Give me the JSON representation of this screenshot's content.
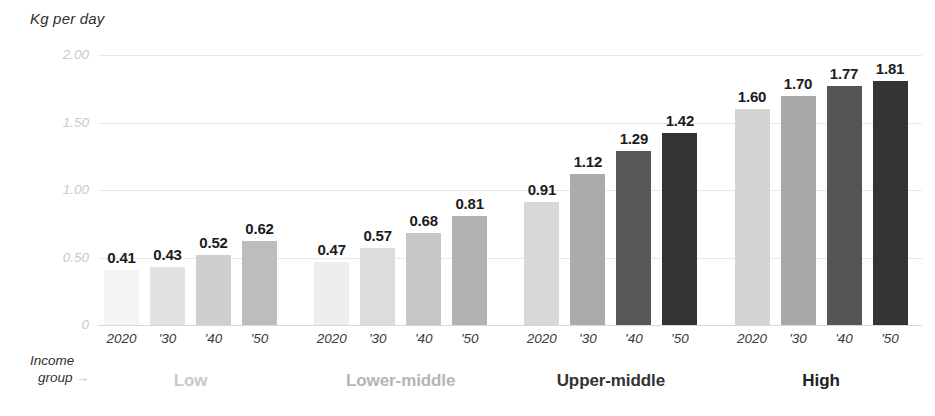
{
  "chart_data": {
    "type": "bar",
    "title": "",
    "ylabel": "Kg per day",
    "xlabel": "Income group",
    "ylim": [
      0,
      2.0
    ],
    "grid": true,
    "legend": "none",
    "yticks": [
      "0",
      "0.50",
      "1.00",
      "1.50",
      "2.00"
    ],
    "ytick_values": [
      0,
      0.5,
      1.0,
      1.5,
      2.0
    ],
    "categories": [
      "2020",
      "'30",
      "'40",
      "'50"
    ],
    "groups": [
      {
        "name": "Low",
        "label_color": "#c9c9c9",
        "bars": [
          {
            "x": "2020",
            "value": 0.41,
            "label": "0.41",
            "color": "#f4f4f4"
          },
          {
            "x": "'30",
            "value": 0.43,
            "label": "0.43",
            "color": "#e2e2e2"
          },
          {
            "x": "'40",
            "value": 0.52,
            "label": "0.52",
            "color": "#cfcfcf"
          },
          {
            "x": "'50",
            "value": 0.62,
            "label": "0.62",
            "color": "#bdbdbd"
          }
        ]
      },
      {
        "name": "Lower-middle",
        "label_color": "#b5b5b5",
        "bars": [
          {
            "x": "2020",
            "value": 0.47,
            "label": "0.47",
            "color": "#eeeeee"
          },
          {
            "x": "'30",
            "value": 0.57,
            "label": "0.57",
            "color": "#dcdcdc"
          },
          {
            "x": "'40",
            "value": 0.68,
            "label": "0.68",
            "color": "#c6c6c6"
          },
          {
            "x": "'50",
            "value": 0.81,
            "label": "0.81",
            "color": "#b2b2b2"
          }
        ]
      },
      {
        "name": "Upper-middle",
        "label_color": "#333333",
        "bars": [
          {
            "x": "2020",
            "value": 0.91,
            "label": "0.91",
            "color": "#d8d8d8"
          },
          {
            "x": "'30",
            "value": 1.12,
            "label": "1.12",
            "color": "#ababab"
          },
          {
            "x": "'40",
            "value": 1.29,
            "label": "1.29",
            "color": "#585858"
          },
          {
            "x": "'50",
            "value": 1.42,
            "label": "1.42",
            "color": "#333333"
          }
        ]
      },
      {
        "name": "High",
        "label_color": "#222222",
        "bars": [
          {
            "x": "2020",
            "value": 1.6,
            "label": "1.60",
            "color": "#d4d4d4"
          },
          {
            "x": "'30",
            "value": 1.7,
            "label": "1.70",
            "color": "#a8a8a8"
          },
          {
            "x": "'40",
            "value": 1.77,
            "label": "1.77",
            "color": "#555555"
          },
          {
            "x": "'50",
            "value": 1.81,
            "label": "1.81",
            "color": "#343434"
          }
        ]
      }
    ]
  },
  "axis": {
    "y_title": "Kg per day"
  },
  "caption": {
    "line1": "Income",
    "line2": "group",
    "arrow": "→"
  },
  "colors": {
    "gridline": "#e8e8e8",
    "baseline": "#d8d8d8",
    "value_label": "#1c1c1c",
    "ytick_label": "#c9c9c9",
    "xtick_label": "#3a3a3a",
    "background": "#ffffff"
  }
}
